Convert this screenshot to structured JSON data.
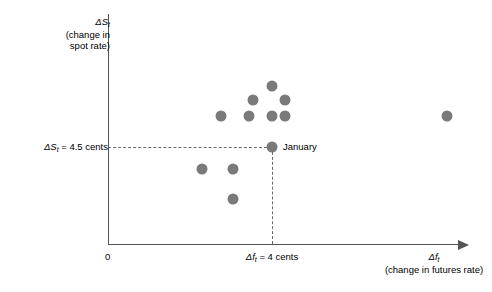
{
  "chart_data": {
    "type": "scatter",
    "title": "",
    "xlabel": "Δf_t (change in futures rate)",
    "ylabel": "ΔS_t (change in spot rate)",
    "grid": false,
    "legend": null,
    "x": [
      5.2,
      3.7,
      4.4,
      2.2,
      3.3,
      4.0,
      4.4,
      11.4,
      1.5,
      2.7,
      2.7,
      4.0
    ],
    "y": [
      7.6,
      6.7,
      6.7,
      5.8,
      5.8,
      5.8,
      5.8,
      5.8,
      3.1,
      3.1,
      1.2,
      4.5
    ],
    "points": [
      {
        "px": 272,
        "py": 86,
        "label": ""
      },
      {
        "px": 253,
        "py": 100,
        "label": ""
      },
      {
        "px": 285,
        "py": 100,
        "label": ""
      },
      {
        "px": 221,
        "py": 116,
        "label": ""
      },
      {
        "px": 249,
        "py": 116,
        "label": ""
      },
      {
        "px": 272,
        "py": 116,
        "label": ""
      },
      {
        "px": 285,
        "py": 116,
        "label": ""
      },
      {
        "px": 447,
        "py": 116,
        "label": ""
      },
      {
        "px": 202,
        "py": 169,
        "label": ""
      },
      {
        "px": 233,
        "py": 169,
        "label": ""
      },
      {
        "px": 233,
        "py": 199,
        "label": ""
      },
      {
        "px": 272,
        "py": 147,
        "label": "January"
      }
    ],
    "reference_lines": {
      "horizontal_value": "4.5 cents",
      "vertical_value": "4 cents"
    },
    "marker_color": "#7a7a7a",
    "axis_color": "#555555"
  },
  "axes": {
    "origin_label": "0",
    "y_title_line1": "ΔS",
    "y_title_sub1": "t",
    "y_title_line2": "(change in",
    "y_title_line3": "spot rate)",
    "x_title_main": "Δf",
    "x_title_sub": "t",
    "x_title_line2": "(change in futures rate)"
  },
  "reference": {
    "y_label_prefix": "ΔS",
    "y_label_sub": "t",
    "y_label_suffix": " = 4.5 cents",
    "x_label_prefix": "Δf",
    "x_label_sub": "t",
    "x_label_suffix": " = 4 cents"
  },
  "annotations": {
    "january": "January"
  }
}
